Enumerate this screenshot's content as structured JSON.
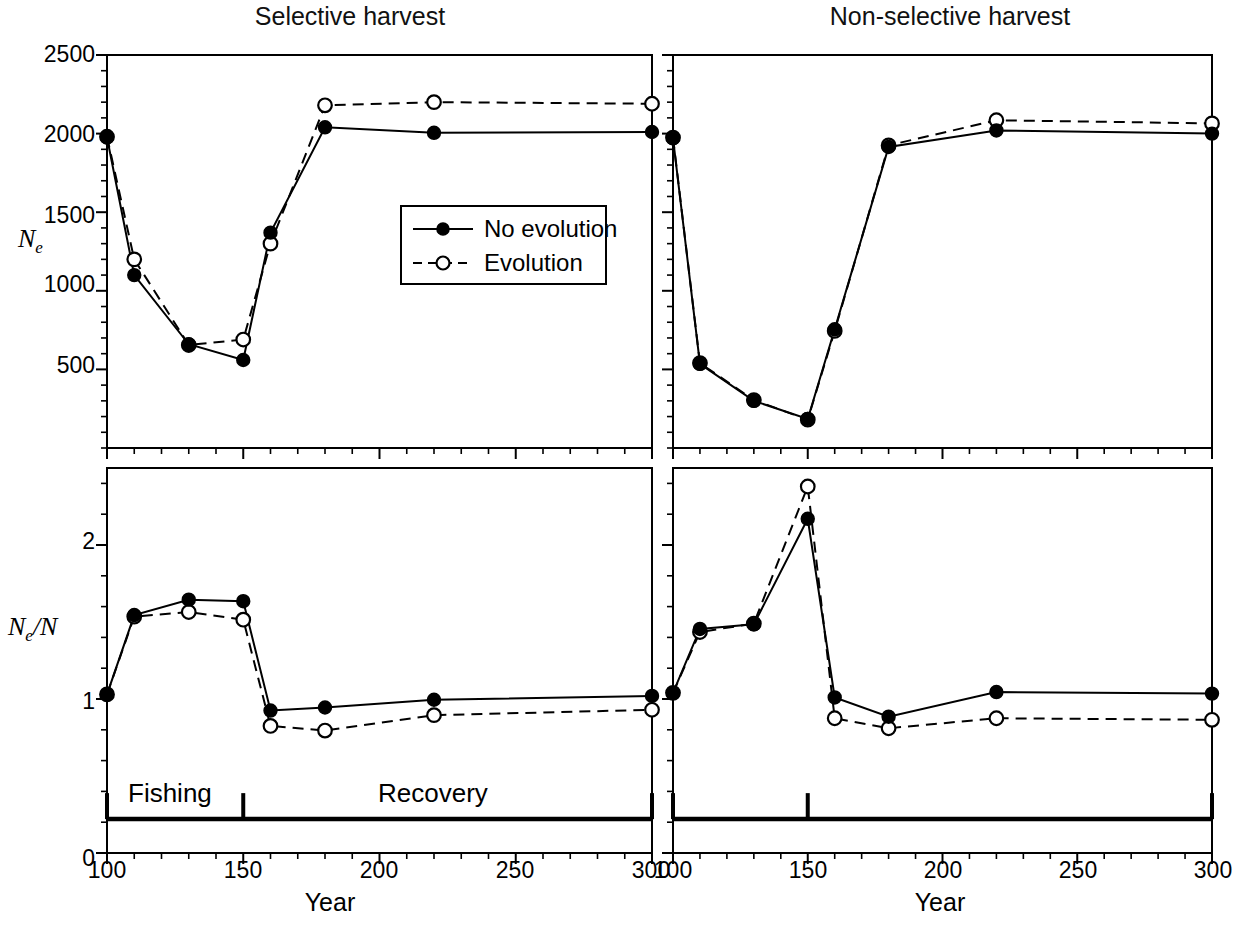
{
  "figure": {
    "panels": [
      {
        "id": "top-left",
        "title": "Selective harvest",
        "ylabel": "Ne",
        "ylabel_base": "N",
        "ylabel_sub": "e"
      },
      {
        "id": "top-right",
        "title": "Non-selective harvest",
        "ylabel": "",
        "ylabel_base": "",
        "ylabel_sub": ""
      },
      {
        "id": "bottom-left",
        "title": "",
        "ylabel": "Ne/N",
        "ylabel_base": "N",
        "ylabel_sub": "e",
        "ylabel_tail": "/N"
      },
      {
        "id": "bottom-right",
        "title": "",
        "ylabel": "",
        "ylabel_base": "",
        "ylabel_sub": ""
      }
    ],
    "xlabel": "Year",
    "legend": {
      "entries": [
        {
          "label": "No evolution",
          "style": "solid",
          "marker": "filled-circle",
          "color": "#000000"
        },
        {
          "label": "Evolution",
          "style": "dashed",
          "marker": "open-circle",
          "color": "#000000"
        }
      ]
    },
    "annotations": [
      {
        "name": "fishing-label",
        "text": "Fishing"
      },
      {
        "name": "recovery-label",
        "text": "Recovery"
      }
    ]
  },
  "chart_data": [
    {
      "type": "line",
      "panel": "top-left",
      "title": "Selective harvest",
      "xlabel": "Year",
      "ylabel": "Ne",
      "xlim": [
        100,
        300
      ],
      "ylim": [
        0,
        2500
      ],
      "xticks": [
        100,
        150,
        200,
        250,
        300
      ],
      "xtick_labels": [
        "100",
        "150",
        "200",
        "250",
        "300"
      ],
      "yticks": [
        500,
        1000,
        1500,
        2000,
        2500
      ],
      "ytick_labels": [
        "500",
        "1000",
        "1500",
        "2000",
        "2500"
      ],
      "minor_x_interval": 10,
      "minor_y_interval": 100,
      "grid": false,
      "legend_position": "inside-center",
      "x": [
        100,
        110,
        130,
        150,
        160,
        180,
        220,
        300
      ],
      "series": [
        {
          "name": "No evolution",
          "style": "solid",
          "marker": "filled-circle",
          "values": [
            1975,
            1100,
            660,
            560,
            1370,
            2040,
            2005,
            2010
          ]
        },
        {
          "name": "Evolution",
          "style": "dashed",
          "marker": "open-circle",
          "values": [
            1980,
            1200,
            655,
            690,
            1300,
            2180,
            2200,
            2190
          ]
        }
      ]
    },
    {
      "type": "line",
      "panel": "top-right",
      "title": "Non-selective harvest",
      "xlabel": "Year",
      "ylabel": "",
      "xlim": [
        100,
        300
      ],
      "ylim": [
        0,
        2500
      ],
      "xticks": [
        100,
        150,
        200,
        250,
        300
      ],
      "xtick_labels": [
        "100",
        "150",
        "200",
        "250",
        "300"
      ],
      "yticks": [
        500,
        1000,
        1500,
        2000,
        2500
      ],
      "ytick_labels": [
        "",
        "",
        "",
        "",
        ""
      ],
      "minor_x_interval": 10,
      "minor_y_interval": 100,
      "grid": false,
      "x": [
        100,
        110,
        130,
        150,
        160,
        180,
        220,
        300
      ],
      "series": [
        {
          "name": "No evolution",
          "style": "solid",
          "marker": "filled-circle",
          "values": [
            1970,
            535,
            300,
            185,
            755,
            1915,
            2020,
            2000
          ]
        },
        {
          "name": "Evolution",
          "style": "dashed",
          "marker": "open-circle",
          "values": [
            1975,
            540,
            305,
            180,
            745,
            1925,
            2085,
            2065
          ]
        }
      ]
    },
    {
      "type": "line",
      "panel": "bottom-left",
      "title": "",
      "xlabel": "Year",
      "ylabel": "Ne/N",
      "xlim": [
        100,
        300
      ],
      "ylim": [
        0,
        2.5
      ],
      "xticks": [
        100,
        150,
        200,
        250,
        300
      ],
      "xtick_labels": [
        "100",
        "150",
        "200",
        "250",
        "300"
      ],
      "yticks": [
        0,
        1,
        2
      ],
      "ytick_labels": [
        "0",
        "1",
        "2"
      ],
      "minor_x_interval": 10,
      "minor_y_interval": 0.2,
      "grid": false,
      "x": [
        100,
        110,
        130,
        150,
        160,
        180,
        220,
        300
      ],
      "series": [
        {
          "name": "No evolution",
          "style": "solid",
          "marker": "filled-circle",
          "values": [
            1.03,
            1.545,
            1.645,
            1.635,
            0.925,
            0.945,
            0.995,
            1.02
          ]
        },
        {
          "name": "Evolution",
          "style": "dashed",
          "marker": "open-circle",
          "values": [
            1.03,
            1.535,
            1.565,
            1.515,
            0.825,
            0.795,
            0.895,
            0.93
          ]
        }
      ],
      "phase_bar": {
        "fishing": {
          "label": "Fishing",
          "from": 100,
          "to": 150
        },
        "recovery": {
          "label": "Recovery",
          "from": 150,
          "to": 300
        },
        "ticks": [
          100,
          150,
          300
        ],
        "y_value": 0.22
      }
    },
    {
      "type": "line",
      "panel": "bottom-right",
      "title": "",
      "xlabel": "Year",
      "ylabel": "",
      "xlim": [
        100,
        300
      ],
      "ylim": [
        0,
        2.5
      ],
      "xticks": [
        100,
        150,
        200,
        250,
        300
      ],
      "xtick_labels": [
        "100",
        "150",
        "200",
        "250",
        "300"
      ],
      "yticks": [
        0,
        1,
        2
      ],
      "ytick_labels": [
        "",
        "",
        ""
      ],
      "minor_x_interval": 10,
      "minor_y_interval": 0.2,
      "grid": false,
      "x": [
        100,
        110,
        130,
        150,
        160,
        180,
        220,
        300
      ],
      "series": [
        {
          "name": "No evolution",
          "style": "solid",
          "marker": "filled-circle",
          "values": [
            1.04,
            1.455,
            1.485,
            2.17,
            1.01,
            0.885,
            1.045,
            1.035
          ]
        },
        {
          "name": "Evolution",
          "style": "dashed",
          "marker": "open-circle",
          "values": [
            1.04,
            1.435,
            1.49,
            2.38,
            0.875,
            0.81,
            0.875,
            0.865
          ]
        }
      ],
      "phase_bar": {
        "fishing": {
          "label": "",
          "from": 100,
          "to": 150
        },
        "recovery": {
          "label": "",
          "from": 150,
          "to": 300
        },
        "ticks": [
          100,
          150,
          300
        ],
        "y_value": 0.22
      }
    }
  ]
}
